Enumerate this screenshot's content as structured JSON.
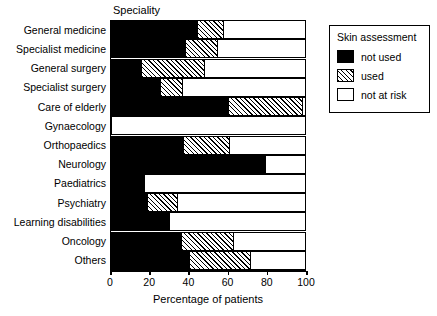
{
  "chart_data": {
    "type": "bar",
    "orientation": "horizontal",
    "stacked": true,
    "stack_mode": "percent",
    "title": "Speciality",
    "xlabel": "Percentage of patients",
    "ylabel": "Speciality",
    "xlim": [
      0,
      100
    ],
    "xticks": [
      0,
      20,
      40,
      60,
      80,
      100
    ],
    "xtick_labels": [
      "0",
      "20",
      "40",
      "60",
      "80",
      "100"
    ],
    "grid": false,
    "legend_position": "top-right",
    "legend_title": "Skin assessment",
    "categories": [
      "General medicine",
      "Specialist medicine",
      "General surgery",
      "Specialist surgery",
      "Care of elderly",
      "Gynaecology",
      "Orthopaedics",
      "Neurology",
      "Paediatrics",
      "Psychiatry",
      "Learning disabilities",
      "Oncology",
      "Others"
    ],
    "series": [
      {
        "name": "not used",
        "fill": "solid-black",
        "color": "#000000",
        "values": [
          44,
          38,
          15,
          25,
          60,
          0,
          37,
          80,
          17,
          18,
          30,
          36,
          40
        ]
      },
      {
        "name": "used",
        "fill": "diagonal-hatch",
        "color": "#ffffff",
        "values": [
          14,
          17,
          33,
          12,
          39,
          0,
          24,
          0,
          0,
          16,
          0,
          27,
          32
        ]
      },
      {
        "name": "not at risk",
        "fill": "white",
        "color": "#ffffff",
        "values": [
          42,
          45,
          52,
          63,
          1,
          100,
          39,
          20,
          83,
          66,
          70,
          37,
          28
        ]
      }
    ]
  },
  "legend": {
    "title": "Skin assessment",
    "entries": [
      {
        "label": "not used",
        "swatch": "sw-notused"
      },
      {
        "label": "used",
        "swatch": "sw-used"
      },
      {
        "label": "not at risk",
        "swatch": "sw-notatrisk"
      }
    ]
  }
}
